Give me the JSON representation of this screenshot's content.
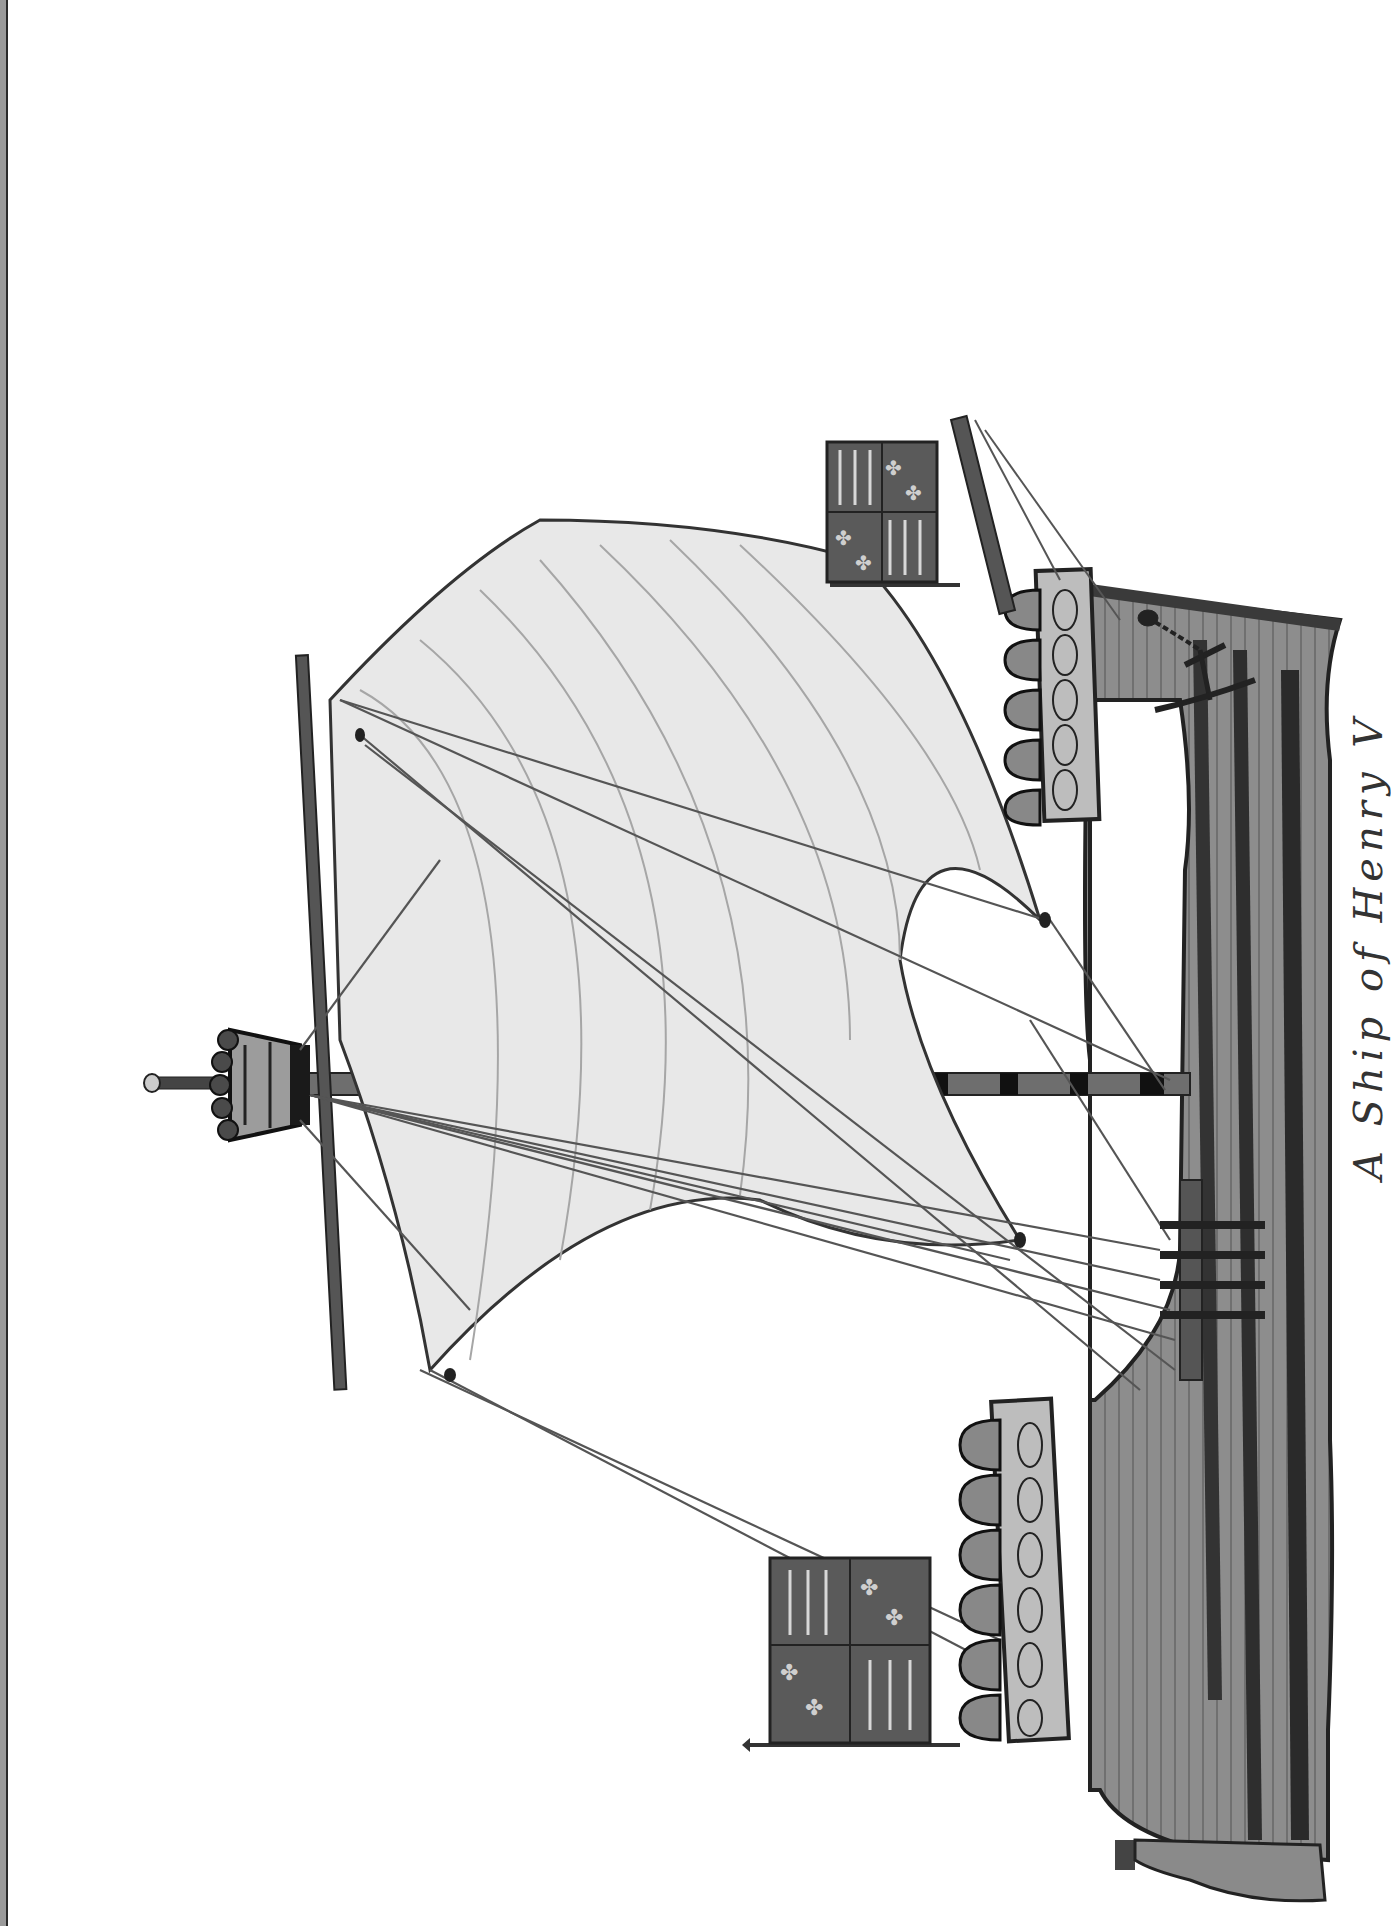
{
  "artwork": {
    "subject": "Medieval single-masted ship (cog) illustration, rotated 90 degrees",
    "orientation": "rotated clockwise",
    "caption": "A Ship of Henry V",
    "caption_visibility": "partially cut off at right edge",
    "palette": {
      "background": "#ffffff",
      "hull": "#8a8a8a",
      "hull_dark_wales": "#3a3a3a",
      "sail": "#e6e6e6",
      "sail_seams": "#a8a8a8",
      "rigging": "#555555",
      "castle": "#b5b5b5",
      "flag_field": "#5a5a5a",
      "flag_charges": "#c8c8c8",
      "border_strip": "#9a9a9a"
    },
    "elements": [
      {
        "name": "hull",
        "description": "Planked hull with dark wales"
      },
      {
        "name": "mast",
        "description": "Banded mast with crow's nest fighting top"
      },
      {
        "name": "crows-nest",
        "description": "Crenellated fighting top at masthead"
      },
      {
        "name": "main-sail",
        "description": "Billowing square sail on yard"
      },
      {
        "name": "fore-castle",
        "description": "Castle with arched shields, right side"
      },
      {
        "name": "aft-castle",
        "description": "Castle with arched shields, left side"
      },
      {
        "name": "fore-flag",
        "description": "Quartered banner with fleurs-de-lis and lions"
      },
      {
        "name": "aft-flag",
        "description": "Quartered banner with fleurs-de-lis and lions"
      },
      {
        "name": "bowsprit",
        "description": "Spar projecting from bow"
      },
      {
        "name": "anchor",
        "description": "Anchor with chain on hull"
      },
      {
        "name": "rudder",
        "description": "Stern rudder"
      }
    ]
  }
}
